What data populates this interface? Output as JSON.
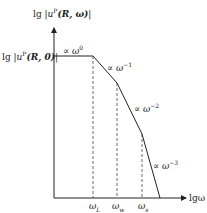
{
  "y_axis_label": {
    "prefix": "lg",
    "expr": "u",
    "sup": "P",
    "args": "(R, ω)"
  },
  "y_ref_label": {
    "prefix": "lg",
    "expr": "u",
    "sup": "P",
    "args": "(R, 0)"
  },
  "x_axis_label": "lgω",
  "ticks": [
    {
      "label": "ω",
      "sub": "L"
    },
    {
      "label": "ω",
      "sub": "w"
    },
    {
      "label": "ω",
      "sub": "s"
    }
  ],
  "slopes": [
    {
      "base": "∝ ω",
      "exp": "0"
    },
    {
      "base": "∝ ω",
      "exp": "−1"
    },
    {
      "base": "∝ ω",
      "exp": "−2"
    },
    {
      "base": "∝ ω",
      "exp": "−3"
    }
  ],
  "colors": {
    "line": "#222222",
    "dash": "#444444"
  }
}
